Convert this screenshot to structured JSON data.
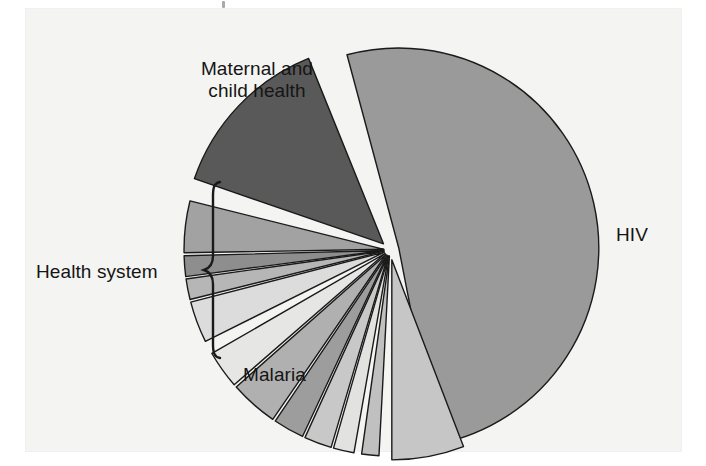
{
  "figure": {
    "background_color": "#f4f4f2",
    "page_color": "#ffffff",
    "outline_color": "#1a1a1a"
  },
  "labels": {
    "maternal_child_health": "Maternal and\nchild health",
    "hiv": "HIV",
    "malaria": "Malaria",
    "health_system": "Health system"
  },
  "chart_data": {
    "type": "pie",
    "title": "",
    "subtitle": "",
    "xlabel": "",
    "ylabel": "",
    "legend_position": "none",
    "exploded": true,
    "grid": false,
    "units": "share of funding (%)",
    "center": {
      "x": 390,
      "y": 250
    },
    "radius": 200,
    "categories": [
      "HIV",
      "Maternal and child health",
      "Health system",
      "Malaria"
    ],
    "values": [
      43,
      13.5,
      31.5,
      6
    ],
    "slices": [
      {
        "label": "HIV",
        "group": "HIV",
        "value": 43,
        "color": "#9a9a9a",
        "start_angle": -79,
        "end_angle": 105,
        "explode": 9,
        "labeled": true
      },
      {
        "label": "Maternal and child health",
        "group": "Maternal and child health",
        "value": 13.5,
        "color": "#595959",
        "start_angle": 112,
        "end_angle": 161,
        "explode": 9,
        "labeled": true
      },
      {
        "label": "Health system 1",
        "group": "Health system",
        "value": 4.3,
        "color": "#a2a2a2",
        "start_angle": 166,
        "end_angle": 181,
        "explode": 6,
        "labeled": false
      },
      {
        "label": "Health system 2",
        "group": "Health system",
        "value": 1.7,
        "color": "#8e8e8e",
        "start_angle": 181.5,
        "end_angle": 187.5,
        "explode": 6,
        "labeled": false
      },
      {
        "label": "Health system 3",
        "group": "Health system",
        "value": 1.7,
        "color": "#b6b6b6",
        "start_angle": 188,
        "end_angle": 194,
        "explode": 6,
        "labeled": false
      },
      {
        "label": "Health system 4",
        "group": "Health system",
        "value": 3.4,
        "color": "#dcdcdc",
        "start_angle": 194.5,
        "end_angle": 206.5,
        "explode": 6,
        "labeled": false
      },
      {
        "label": "Health system 5",
        "group": "Health system",
        "value": 3.1,
        "color": "#e6e6e4",
        "start_angle": 210,
        "end_angle": 221,
        "explode": 6,
        "labeled": false
      },
      {
        "label": "Health system 6",
        "group": "Health system",
        "value": 4.0,
        "color": "#b0b0b0",
        "start_angle": 221.5,
        "end_angle": 235.5,
        "explode": 6,
        "labeled": false
      },
      {
        "label": "Health system 7",
        "group": "Health system",
        "value": 2.6,
        "color": "#9d9d9d",
        "start_angle": 236,
        "end_angle": 245,
        "explode": 6,
        "labeled": false
      },
      {
        "label": "Health system 8",
        "group": "Health system",
        "value": 2.3,
        "color": "#c8c8c8",
        "start_angle": 245.5,
        "end_angle": 253.5,
        "explode": 6,
        "labeled": false
      },
      {
        "label": "Health system 9",
        "group": "Health system",
        "value": 1.7,
        "color": "#e2e2e0",
        "start_angle": 254,
        "end_angle": 260,
        "explode": 6,
        "labeled": false
      },
      {
        "label": "Health system 10",
        "group": "Health system",
        "value": 1.4,
        "color": "#c0c0c0",
        "start_angle": 262,
        "end_angle": 267,
        "explode": 6,
        "labeled": false
      },
      {
        "label": "Malaria",
        "group": "Malaria",
        "value": 6,
        "color": "#c6c6c6",
        "start_angle": 270,
        "end_angle": 291,
        "explode": 10,
        "labeled": true
      }
    ],
    "group_summary": [
      {
        "name": "HIV",
        "value": 43,
        "color": "#9a9a9a"
      },
      {
        "name": "Maternal and child health",
        "value": 13.5,
        "color": "#595959"
      },
      {
        "name": "Health system",
        "value": 31.5,
        "color": "#bdbdbd"
      },
      {
        "name": "Malaria",
        "value": 6,
        "color": "#c6c6c6"
      }
    ]
  }
}
